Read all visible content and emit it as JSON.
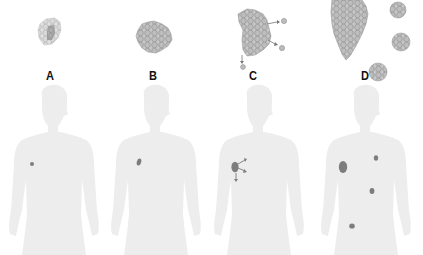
{
  "figure": {
    "colors": {
      "background": "#ffffff",
      "silhouette": "#ededed",
      "tumor": "#8a8a8a",
      "cell_fill": "#c4c4c4",
      "cell_stroke": "#8e8e8e",
      "label": "#111111"
    },
    "stages": [
      {
        "label": "A",
        "cluster": "small-cell-cluster-with-dark-center",
        "body_tumors": 1
      },
      {
        "label": "B",
        "cluster": "larger-cell-mass",
        "body_tumors": 1
      },
      {
        "label": "C",
        "cluster": "tumor-mass-shedding-cells",
        "body_tumors": 1,
        "arrows": 3
      },
      {
        "label": "D",
        "cluster": "large-mass-with-secondary-clusters",
        "body_tumors": 4
      }
    ]
  }
}
